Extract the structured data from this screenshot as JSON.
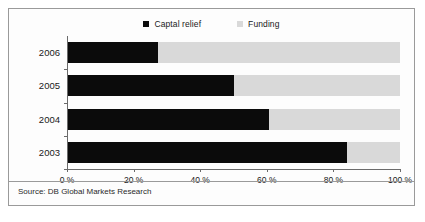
{
  "chart_data": {
    "type": "bar",
    "orientation": "horizontal",
    "stacked": true,
    "title": "",
    "subtitle": "",
    "xlabel": "",
    "ylabel": "",
    "categories": [
      "2006",
      "2005",
      "2004",
      "2003"
    ],
    "series": [
      {
        "name": "Captal relief",
        "color": "#0b0b0b",
        "values": [
          27,
          50,
          60.5,
          84
        ]
      },
      {
        "name": "Funding",
        "color": "#d9d9d9",
        "values": [
          73,
          50,
          39.5,
          16
        ]
      }
    ],
    "xlim": [
      0,
      100
    ],
    "xticks": [
      0,
      20,
      40,
      60,
      80,
      100
    ],
    "xticklabels": [
      "0 %",
      "20 %",
      "40 %",
      "60 %",
      "80 %",
      "100 %"
    ],
    "grid": false,
    "legend_position": "top-center",
    "legend": [
      {
        "label": "Captal relief",
        "marker": "square",
        "color": "#0b0b0b"
      },
      {
        "label": "Funding",
        "marker": "square",
        "color": "#d9d9d9"
      }
    ],
    "source": "Source: DB Global Markets Research"
  },
  "figure": {
    "border_color": "#9a9a9a",
    "background": "#fdfdfd",
    "axis_color": "#6b6b6b"
  }
}
